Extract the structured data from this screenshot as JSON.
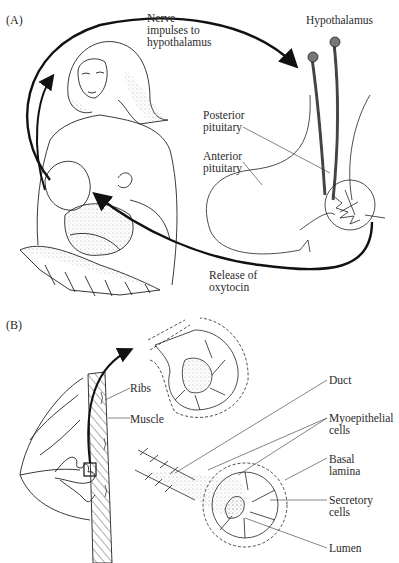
{
  "panels": {
    "a": {
      "tag": "(A)",
      "labels": {
        "nerve": [
          "Nerve",
          "impulses to",
          "hypothalamus"
        ],
        "hypothalamus": "Hypothalamus",
        "posterior": [
          "Posterior",
          "pituitary"
        ],
        "anterior": [
          "Anterior",
          "pituitary"
        ],
        "release": [
          "Release of",
          "oxytocin"
        ]
      }
    },
    "b": {
      "tag": "(B)",
      "labels": {
        "ribs": "Ribs",
        "muscle": "Muscle",
        "duct": "Duct",
        "myoepithelial": [
          "Myoepithelial",
          "cells"
        ],
        "basal": [
          "Basal",
          "lamina"
        ],
        "secretory": [
          "Secretory",
          "cells"
        ],
        "lumen": "Lumen"
      }
    }
  },
  "colors": {
    "ink": "#1a1a1a",
    "stipple": "#9a9a9a",
    "background": "#ffffff"
  }
}
